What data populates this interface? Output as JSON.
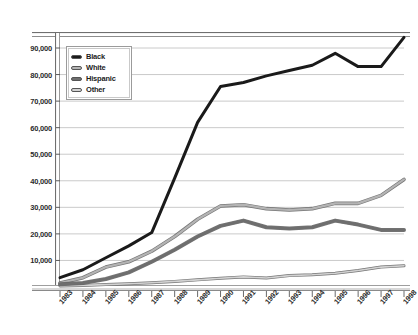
{
  "chart_data": {
    "type": "line",
    "title": "",
    "xlabel": "",
    "ylabel": "",
    "grid": true,
    "legend_position": "top-left-inside",
    "ylim": [
      0,
      100000
    ],
    "ytick_labels": [
      "90,000",
      "80,000",
      "70,000",
      "60,000",
      "50,000",
      "40,000",
      "30,000",
      "20,000",
      "10,000"
    ],
    "ytick_values": [
      90000,
      80000,
      70000,
      60000,
      50000,
      40000,
      30000,
      20000,
      10000
    ],
    "categories": [
      "1983",
      "1984",
      "1985",
      "1986",
      "1987",
      "1988",
      "1989",
      "1990",
      "1991",
      "1992",
      "1993",
      "1994",
      "1995",
      "1996",
      "1997",
      "1998"
    ],
    "series": [
      {
        "name": "Black",
        "color": "#1a1a1a",
        "values": [
          3500,
          6500,
          11000,
          15500,
          20500,
          41000,
          62000,
          75500,
          77000,
          79500,
          81500,
          83500,
          88000,
          83000,
          83000,
          94000
        ]
      },
      {
        "name": "White",
        "color": "#b4b4b4",
        "values": [
          1500,
          3500,
          7500,
          9500,
          13500,
          19000,
          25500,
          30500,
          31000,
          29500,
          29000,
          29500,
          31500,
          31500,
          34500,
          40500
        ]
      },
      {
        "name": "Hispanic",
        "color": "#6e6e6e",
        "values": [
          1000,
          1500,
          3000,
          5500,
          9500,
          14000,
          19000,
          23000,
          25000,
          22500,
          22000,
          22500,
          25000,
          23500,
          21500,
          21500
        ]
      },
      {
        "name": "Other",
        "color": "#d2d2d2",
        "values": [
          400,
          600,
          900,
          1200,
          1600,
          2100,
          2700,
          3300,
          3800,
          3400,
          4300,
          4600,
          5200,
          6200,
          7500,
          8000
        ]
      }
    ]
  },
  "legend": {
    "items": [
      {
        "label": "Black"
      },
      {
        "label": "White"
      },
      {
        "label": "Hispanic"
      },
      {
        "label": "Other"
      }
    ]
  }
}
